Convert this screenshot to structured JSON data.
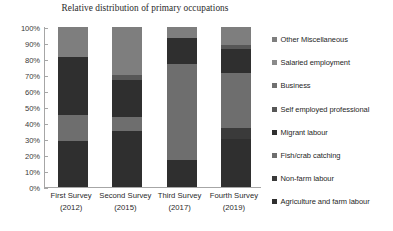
{
  "chart_data": {
    "type": "bar",
    "subtype": "100% stacked bar",
    "title": "Relative distribution of primary occupations",
    "xlabel": "",
    "ylabel": "",
    "ylim": [
      0,
      100
    ],
    "grid": false,
    "legend_position": "right",
    "categories": [
      {
        "label": "First Survey",
        "year": "(2012)"
      },
      {
        "label": "Second Survey",
        "year": "(2015)"
      },
      {
        "label": "Third Survey",
        "year": "(2017)"
      },
      {
        "label": "Fourth Survey",
        "year": "(2019)"
      }
    ],
    "category_labels": [
      "First Survey",
      "Second Survey",
      "Third Survey",
      "Fourth Survey"
    ],
    "y_ticks": [
      "0%",
      "10%",
      "20%",
      "30%",
      "40%",
      "50%",
      "60%",
      "70%",
      "80%",
      "90%",
      "100%"
    ],
    "y_tick_values": [
      0,
      10,
      20,
      30,
      40,
      50,
      60,
      70,
      80,
      90,
      100
    ],
    "series": [
      {
        "name": "Agriculture and farm labour",
        "color": "#2f2f2f",
        "values": [
          29,
          35,
          17,
          30
        ]
      },
      {
        "name": "Non-farm labour",
        "color": "#3a3a3a",
        "values": [
          0,
          0,
          0,
          7
        ]
      },
      {
        "name": "Fish/crab catching",
        "color": "#6e6e6e",
        "values": [
          16,
          9,
          60,
          34
        ]
      },
      {
        "name": "Migrant labour",
        "color": "#2f2f2f",
        "values": [
          36,
          23,
          16,
          15
        ]
      },
      {
        "name": "Self employed professional",
        "color": "#575757",
        "values": [
          0,
          3,
          0,
          3
        ]
      },
      {
        "name": "Business",
        "color": "#707070",
        "values": [
          0,
          0,
          0,
          0
        ]
      },
      {
        "name": "Salaried employment",
        "color": "#8a8a8a",
        "values": [
          0,
          0,
          0,
          0
        ]
      },
      {
        "name": "Other Miscellaneous",
        "color": "#7e7e7e",
        "values": [
          19,
          30,
          7,
          11
        ]
      }
    ],
    "legend_entries": [
      {
        "label": "Other Miscellaneous",
        "color": "#7e7e7e"
      },
      {
        "label": "Salaried employment",
        "color": "#8a8a8a"
      },
      {
        "label": "Business",
        "color": "#707070"
      },
      {
        "label": "Self employed professional",
        "color": "#575757"
      },
      {
        "label": "Migrant labour",
        "color": "#2f2f2f"
      },
      {
        "label": "Fish/crab catching",
        "color": "#6e6e6e"
      },
      {
        "label": "Non-farm labour",
        "color": "#3a3a3a"
      },
      {
        "label": "Agriculture and farm labour",
        "color": "#2f2f2f"
      }
    ]
  }
}
